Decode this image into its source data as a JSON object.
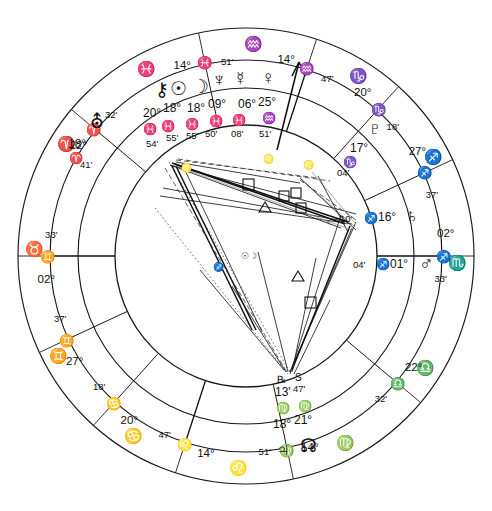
{
  "chart": {
    "type": "astrological-natal-wheel",
    "geometry": {
      "center_x": 246,
      "center_y": 256,
      "outer_radius": 228,
      "zodiac_band_outer": 228,
      "zodiac_band_inner": 196,
      "house_band_outer": 196,
      "house_band_inner": 131,
      "inner_circle_radius": 131
    },
    "outer_ring_signs": [
      {
        "name": "pisces",
        "glyph": "♓",
        "angle_deg": 118
      },
      {
        "name": "aries",
        "glyph": "♈",
        "angle_deg": 148
      },
      {
        "name": "taurus",
        "glyph": "♉",
        "angle_deg": 178
      },
      {
        "name": "gemini",
        "glyph": "♊",
        "angle_deg": 208
      },
      {
        "name": "cancer",
        "glyph": "♋",
        "angle_deg": 238
      },
      {
        "name": "leo",
        "glyph": "♌",
        "angle_deg": 268
      },
      {
        "name": "virgo",
        "glyph": "♍",
        "angle_deg": 298
      },
      {
        "name": "libra",
        "glyph": "♎",
        "angle_deg": 328
      },
      {
        "name": "scorpio",
        "glyph": "♏",
        "angle_deg": 358
      },
      {
        "name": "sagittarius",
        "glyph": "♐",
        "angle_deg": 28
      },
      {
        "name": "capricorn",
        "glyph": "♑",
        "angle_deg": 58
      },
      {
        "name": "aquarius",
        "glyph": "♒",
        "angle_deg": 88
      }
    ],
    "house_cusps": [
      {
        "house": 1,
        "label": "Ascendant",
        "degree": "02°",
        "sign_glyph": "♊",
        "sign": "Gemini",
        "minute": "33'",
        "angle_deg": 180
      },
      {
        "house": 2,
        "degree": "27°",
        "sign_glyph": "♊",
        "sign": "Gemini",
        "minute": "37'",
        "angle_deg": 205
      },
      {
        "house": 3,
        "degree": "20°",
        "sign_glyph": "♋",
        "sign": "Cancer",
        "minute": "18'",
        "angle_deg": 228
      },
      {
        "house": 4,
        "label": "IC",
        "degree": "14°",
        "sign_glyph": "♌",
        "sign": "Leo",
        "minute": "47'",
        "angle_deg": 252
      },
      {
        "house": 5,
        "degree": "14°",
        "sign_glyph": "♍",
        "sign": "Virgo",
        "minute": "51'",
        "angle_deg": 282
      },
      {
        "house": 6,
        "degree": "22°",
        "sign_glyph": "♎",
        "sign": "Libra",
        "minute": "32'",
        "angle_deg": 320
      },
      {
        "house": 7,
        "label": "Descendant",
        "degree": "02°",
        "sign_glyph": "♐",
        "sign": "Sagittarius",
        "minute": "33'",
        "angle_deg": 0
      },
      {
        "house": 8,
        "degree": "27°",
        "sign_glyph": "♐",
        "sign": "Sagittarius",
        "minute": "37'",
        "angle_deg": 25
      },
      {
        "house": 9,
        "degree": "20°",
        "sign_glyph": "♑",
        "sign": "Capricorn",
        "minute": "18'",
        "angle_deg": 48
      },
      {
        "house": 10,
        "label": "MC",
        "degree": "14°",
        "sign_glyph": "♒",
        "sign": "Aquarius",
        "minute": "47'",
        "angle_deg": 72
      },
      {
        "house": 11,
        "degree": "14°",
        "sign_glyph": "♓",
        "sign": "Pisces",
        "minute": "51'",
        "angle_deg": 102
      },
      {
        "house": 12,
        "degree": "22°",
        "sign_glyph": "♈",
        "sign": "Aries",
        "minute": "32'",
        "angle_deg": 140
      }
    ],
    "planets": [
      {
        "name": "chiron",
        "glyph": "⚷",
        "degree": "20°",
        "sign_glyph": "♓",
        "sign": "Pisces",
        "minute": "54'",
        "retrograde": false
      },
      {
        "name": "sun",
        "glyph": "☉",
        "degree": "18°",
        "sign_glyph": "♓",
        "sign": "Pisces",
        "minute": "55'",
        "retrograde": false
      },
      {
        "name": "moon",
        "glyph": "☽",
        "degree": "18°",
        "sign_glyph": "♓",
        "sign": "Pisces",
        "minute": "55'",
        "retrograde": false
      },
      {
        "name": "neptune",
        "glyph": "♆",
        "degree": "09°",
        "sign_glyph": "♓",
        "sign": "Pisces",
        "minute": "50'",
        "retrograde": false
      },
      {
        "name": "mercury",
        "glyph": "☿",
        "degree": "06°",
        "sign_glyph": "♓",
        "sign": "Pisces",
        "minute": "08'",
        "retrograde": false
      },
      {
        "name": "venus",
        "glyph": "♀",
        "degree": "25°",
        "sign_glyph": "♒",
        "sign": "Aquarius",
        "minute": "51'",
        "retrograde": false
      },
      {
        "name": "pluto",
        "glyph": "♇",
        "degree": "17°",
        "sign_glyph": "♑",
        "sign": "Capricorn",
        "minute": "04'",
        "retrograde": false
      },
      {
        "name": "saturn",
        "glyph": "♄",
        "degree": "16°",
        "sign_glyph": "♐",
        "sign": "Sagittarius",
        "minute": "10'",
        "retrograde": false
      },
      {
        "name": "mars",
        "glyph": "♂",
        "degree": "01°",
        "sign_glyph": "♐",
        "sign": "Sagittarius",
        "minute": "04'",
        "retrograde": false
      },
      {
        "name": "jupiter",
        "glyph": "♃",
        "degree": "18°",
        "sign_glyph": "♍",
        "sign": "Virgo",
        "minute": "13'",
        "retrograde": true,
        "retrograde_mark": "℞"
      },
      {
        "name": "north-node",
        "glyph": "☊",
        "degree": "21°",
        "sign_glyph": "♍",
        "sign": "Virgo",
        "minute": "47'",
        "station_mark": "S"
      }
    ],
    "uranus": {
      "name": "uranus",
      "glyph": "⛢",
      "degree": "18°",
      "sign_glyph": "♈",
      "sign": "Aries",
      "minute": "41'"
    },
    "aspect_symbols": [
      {
        "name": "square",
        "glyph": "□"
      },
      {
        "name": "trine",
        "glyph": "△"
      }
    ],
    "mc_marker": {
      "name": "midheaven-arrow",
      "label": "MC"
    }
  }
}
